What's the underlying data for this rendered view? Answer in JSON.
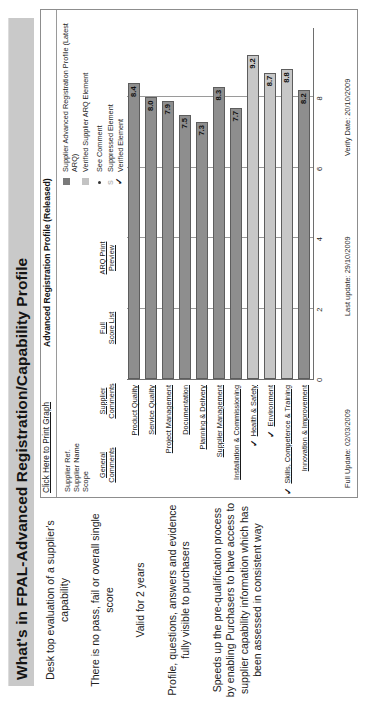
{
  "slide": {
    "title": "What's in FPAL-Advanced Registration/Capability Profile"
  },
  "bullets": [
    "Desk top evaluation of a supplier's capability",
    "There is no pass, fail or overall single score",
    "Valid for 2 years",
    "Profile, questions, answers and evidence fully visible to purchasers",
    "Speeds up the pre-qualification process by enabling Purchasers to have access to supplier capability information which has been assessed in consistent way"
  ],
  "report": {
    "print_link": "Click Here to Print Graph",
    "header_title": "Advanced Registration Profile (Released)",
    "supplier_block": [
      "Supplier Ref.",
      "Supplier Name",
      "Scope"
    ],
    "links": [
      {
        "line1": "General",
        "line2": "Comments"
      },
      {
        "line1": "Supplier",
        "line2": "Comments"
      },
      {
        "line1": "Full",
        "line2": "Score List"
      },
      {
        "line1": "ARQ Print",
        "line2": "Preview"
      }
    ],
    "legend": [
      {
        "swatch": "dark-swatch",
        "label": "Supplier Advanced Registration Profile (Latest ARQ)"
      },
      {
        "swatch": "light-swatch",
        "label": "Verified Supplier ARQ Element"
      },
      {
        "swatch": "dot-marker",
        "label": "See Comment"
      },
      {
        "swatch": "s-marker",
        "label": "Suppressed Element"
      },
      {
        "swatch": "tick-marker",
        "label": "Verified Element"
      }
    ],
    "footer": {
      "full_update": "Full Update: 02/03/2009",
      "last_update": "Last update: 29/10/2009",
      "verify_date": "Verify Date: 20/10/2009"
    }
  },
  "chart_data": {
    "type": "bar",
    "title": "Advanced Registration Profile (Released)",
    "xlabel": "",
    "ylabel": "",
    "xlim": [
      0,
      10
    ],
    "ticks": [
      "0",
      "2",
      "4",
      "6",
      "8"
    ],
    "grid": true,
    "legend_position": "top-right",
    "categories": [
      "Product Quality",
      "Service Quality",
      "Project Management",
      "Documentation",
      "Planning & Delivery",
      "Supplier Management",
      "Installation & Commissioning",
      "Health & Safety",
      "Environment",
      "Skills, Competence & Training",
      "Innovation & Improvement"
    ],
    "values": [
      8.4,
      8.0,
      7.9,
      7.5,
      7.3,
      8.3,
      7.7,
      9.2,
      8.7,
      8.8,
      8.2
    ],
    "series_of_bar": [
      "dark",
      "dark",
      "dark",
      "dark",
      "dark",
      "dark",
      "dark",
      "light",
      "light",
      "light",
      "dark"
    ],
    "verified_markers": [
      "",
      "",
      "",
      "",
      "",
      "",
      "",
      "✓",
      "✓",
      "✓",
      ""
    ],
    "series": [
      {
        "name": "Supplier Advanced Registration Profile (Latest ARQ)",
        "color": "#8e8e8e"
      },
      {
        "name": "Verified Supplier ARQ Element",
        "color": "#c7c7c7"
      }
    ]
  }
}
